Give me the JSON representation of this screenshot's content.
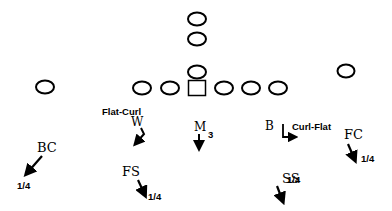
{
  "diagram": {
    "type": "football-defensive-coverage",
    "colors": {
      "ink": "#000000",
      "background": "#ffffff"
    },
    "offense": [
      {
        "id": "wr-left",
        "shape": "circle",
        "x": 45,
        "y": 87
      },
      {
        "id": "lt",
        "shape": "circle",
        "x": 142,
        "y": 88
      },
      {
        "id": "lg",
        "shape": "circle",
        "x": 170,
        "y": 88
      },
      {
        "id": "center",
        "shape": "square",
        "x": 197,
        "y": 88
      },
      {
        "id": "rg",
        "shape": "circle",
        "x": 224,
        "y": 88
      },
      {
        "id": "rt",
        "shape": "circle",
        "x": 251,
        "y": 88
      },
      {
        "id": "te",
        "shape": "circle",
        "x": 278,
        "y": 88
      },
      {
        "id": "qb",
        "shape": "circle",
        "x": 197,
        "y": 72
      },
      {
        "id": "fb",
        "shape": "circle",
        "x": 197,
        "y": 39
      },
      {
        "id": "tb",
        "shape": "circle",
        "x": 197,
        "y": 19
      },
      {
        "id": "wr-right",
        "shape": "circle",
        "x": 346,
        "y": 71
      }
    ],
    "defense": {
      "w": {
        "label": "W",
        "assignment": "Flat-Curl"
      },
      "m": {
        "label": "M",
        "assignment": "3"
      },
      "b": {
        "label": "B",
        "assignment": "Curl-Flat"
      },
      "bc": {
        "label": "BC",
        "assignment": "1/4"
      },
      "fc": {
        "label": "FC",
        "assignment": "1/4"
      },
      "fs": {
        "label": "FS",
        "assignment": "1/4"
      },
      "ss": {
        "label": "SS",
        "assignment": "1/4"
      }
    }
  }
}
